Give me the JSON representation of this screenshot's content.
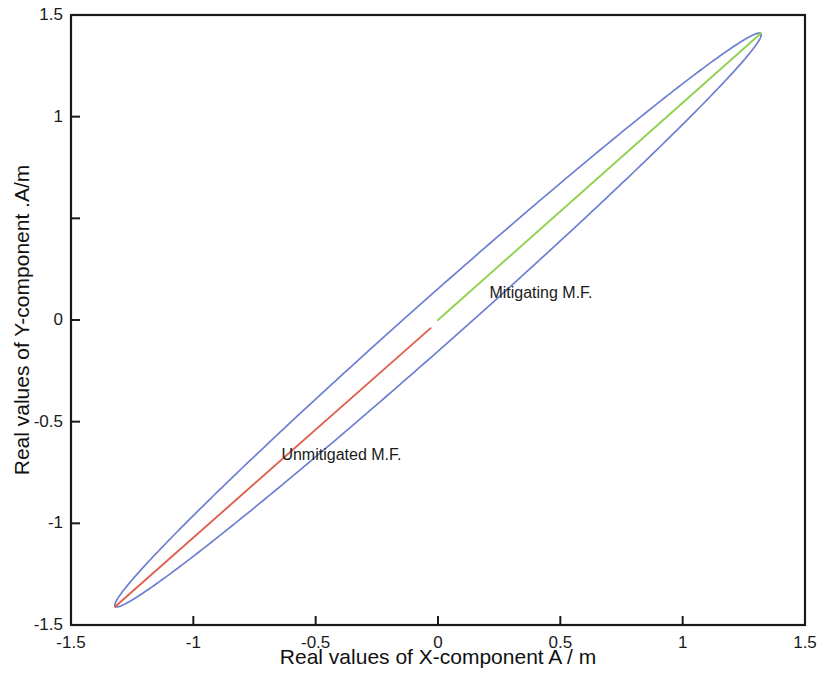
{
  "chart_data": {
    "type": "line",
    "title": "",
    "xlabel": "Real values of X-component A / m",
    "ylabel": "Real values of Y-component .A/m",
    "xlim": [
      -1.5,
      1.5
    ],
    "ylim": [
      -1.5,
      1.5
    ],
    "grid": false,
    "legend": "none",
    "xticks": [
      {
        "value": -1.5,
        "label": "-1.5"
      },
      {
        "value": -1,
        "label": "-1"
      },
      {
        "value": -0.5,
        "label": "-0.5"
      },
      {
        "value": 0,
        "label": "0"
      },
      {
        "value": 0.5,
        "label": "0.5"
      },
      {
        "value": 1,
        "label": "1"
      },
      {
        "value": 1.5,
        "label": "1.5"
      }
    ],
    "yticks": [
      {
        "value": -1.5,
        "label": "-1.5"
      },
      {
        "value": -1,
        "label": "-1"
      },
      {
        "value": -0.5,
        "label": "-0.5"
      },
      {
        "value": 0,
        "label": "0"
      },
      {
        "value": 0.5,
        "label": ""
      },
      {
        "value": 1,
        "label": "1"
      },
      {
        "value": 1.5,
        "label": "1.5"
      }
    ],
    "series": [
      {
        "name": "ellipse-locus",
        "color": "#6d7fd0",
        "type": "closed-curve",
        "description": "Narrow tilted ellipse locus of the magnetic field vector",
        "ellipse": {
          "center_x": 0.0,
          "center_y": 0.0,
          "semi_major": 1.93,
          "semi_minor": 0.105,
          "rotation_deg": 46.9
        },
        "extreme_points": [
          {
            "x": -1.32,
            "y": -1.41
          },
          {
            "x": 1.32,
            "y": 1.41
          }
        ]
      },
      {
        "name": "Unmitigated M.F.",
        "color": "#e06050",
        "type": "segment",
        "points": [
          {
            "x": -1.32,
            "y": -1.41
          },
          {
            "x": -0.03,
            "y": -0.04
          }
        ]
      },
      {
        "name": "Mitigating M.F.",
        "color": "#8fd14f",
        "type": "segment",
        "points": [
          {
            "x": 0.0,
            "y": 0.0
          },
          {
            "x": 1.32,
            "y": 1.41
          }
        ]
      }
    ],
    "annotations": [
      {
        "text": "Mitigating M.F.",
        "x": 0.21,
        "y": 0.13
      },
      {
        "text": "Unmitigated M.F.",
        "x": -0.64,
        "y": -0.67
      }
    ],
    "colors": {
      "ellipse": "#6d7fd0",
      "unmitigated": "#e06050",
      "mitigating": "#8fd14f",
      "axis": "#1a1a1a",
      "background": "#ffffff"
    }
  }
}
